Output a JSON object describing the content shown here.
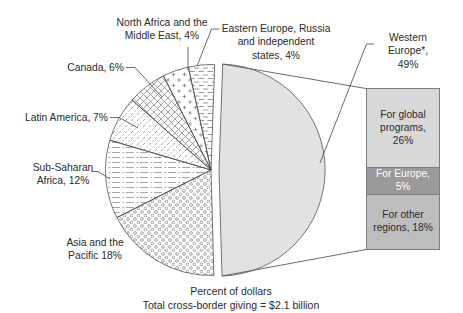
{
  "chart_data": {
    "type": "pie",
    "title": "Percent of dollars",
    "subtitle": "Total cross-border giving = $2.1 billion",
    "legend_position": "none",
    "slices": [
      {
        "name": "western-europe",
        "label": "Western\nEurope*, 49%",
        "value": 49,
        "color": "#e2e2e2",
        "exploded": true
      },
      {
        "name": "asia-pacific",
        "label": "Asia and the\nPacific 18%",
        "value": 18,
        "pattern": "circles"
      },
      {
        "name": "sub-saharan-africa",
        "label": "Sub-Saharan\nAfrica, 12%",
        "value": 12,
        "pattern": "horizontal-dash-dot"
      },
      {
        "name": "latin-america",
        "label": "Latin America, 7%",
        "value": 7,
        "pattern": "diagonal-dotted"
      },
      {
        "name": "canada",
        "label": "Canada, 6%",
        "value": 6,
        "pattern": "crosshatch"
      },
      {
        "name": "north-africa-middle-east",
        "label": "North Africa and the\nMiddle East, 4%",
        "value": 4,
        "pattern": "plus-dots"
      },
      {
        "name": "eastern-europe-russia",
        "label": "Eastern Europe, Russia\nand independent\nstates, 4%",
        "value": 4,
        "pattern": "horizontal-dashes"
      }
    ],
    "breakout": {
      "parent": "Western Europe*, 49%",
      "segments": [
        {
          "label": "For global programs, 26%",
          "value": 26,
          "color": "#d8d8d8",
          "text_color": "#2b2b2b"
        },
        {
          "label": "For Europe, 5%",
          "value": 5,
          "color": "#9a9a9a",
          "text_color": "#ffffff"
        },
        {
          "label": "For other regions, 18%",
          "value": 18,
          "color": "#bdbdbd",
          "text_color": "#2b2b2b"
        }
      ]
    }
  }
}
